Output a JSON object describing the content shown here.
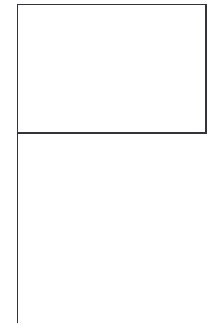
{
  "document": {
    "title": "Blank flag on pole",
    "description": "Simple black outline line drawing of an empty rectangular flag attached to a vertical flagpole",
    "width": 216,
    "height": 330,
    "background_color": "#ffffff"
  },
  "drawing": {
    "stroke_color": "#33333a",
    "fill_color": "#ffffff",
    "stroke_width": 1.3,
    "flag": {
      "name": "flag banner",
      "shape": "rectangle",
      "x": 17.5,
      "y": 4.5,
      "width": 188.5,
      "height": 128.5,
      "fill": "none"
    },
    "pole": {
      "name": "flag pole",
      "shape": "line",
      "x": 17.5,
      "y_top": 4.5,
      "y_bottom": 323
    }
  },
  "labels": {
    "caption": "",
    "alt_text": "Outline of a blank rectangular flag on a vertical pole"
  }
}
